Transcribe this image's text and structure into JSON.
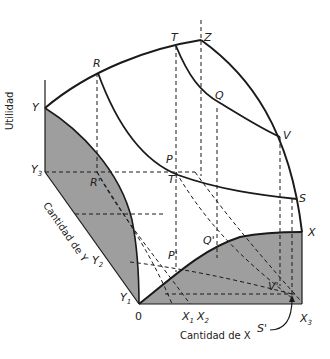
{
  "diagram": {
    "axes": {
      "vertical": "Utilidad",
      "diagonal": "Cantidad de Y",
      "horizontal": "Cantidad de X"
    },
    "points": {
      "Y": "Y",
      "R": "R",
      "T": "T",
      "Z": "Z",
      "Q": "Q",
      "V": "V",
      "P": "P",
      "S": "S",
      "X": "X",
      "R_prime": "R'",
      "T_prime": "T'",
      "P_prime": "P'",
      "Q_prime": "Q'",
      "V_prime": "V'",
      "S_prime": "S'",
      "O": "0"
    },
    "ticks": {
      "Y3": "Y",
      "Y3_sub": "3",
      "Y2": "Y",
      "Y2_sub": "2",
      "Y1": "Y",
      "Y1_sub": "1",
      "X1": "X",
      "X1_sub": "1",
      "X2": "X",
      "X2_sub": "2",
      "X3": "X",
      "X3_sub": "3"
    },
    "colors": {
      "shade": "#9a9a9a",
      "line": "#1a1a1a"
    }
  }
}
